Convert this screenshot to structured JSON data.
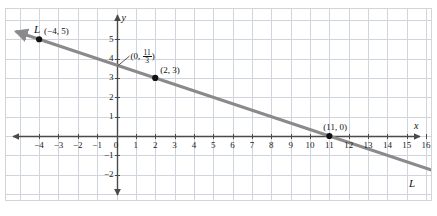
{
  "figure": {
    "width": 437,
    "height": 216,
    "background_color": "#ffffff",
    "frame_color": "#d4d4d4"
  },
  "chart_data": {
    "type": "line",
    "title": "",
    "xlabel": "x",
    "ylabel": "y",
    "xlim": [
      -5,
      17
    ],
    "ylim": [
      -2.7,
      5.9
    ],
    "grid": true,
    "grid_color": "#cfd4dd",
    "legend": "none",
    "axis_color": "#4a4a4a",
    "series": [
      {
        "name": "L",
        "color": "#8a8a8a",
        "slope": -0.3333333333,
        "intercept": 3.6666666667,
        "equation": "y = -1/3 x + 11/3",
        "x": [
          -5.2,
          17.0
        ],
        "y": [
          5.4,
          -2.0
        ],
        "arrow_start": true,
        "arrow_end": true,
        "points": [
          {
            "x": -4,
            "y": 5,
            "label": "(-4, 5)",
            "marker": true
          },
          {
            "x": 0,
            "y": 3.6666666667,
            "label": "(0, 11/3)",
            "marker": false
          },
          {
            "x": 2,
            "y": 3,
            "label": "(2, 3)",
            "marker": true
          },
          {
            "x": 11,
            "y": 0,
            "label": "(11, 0)",
            "marker": true
          }
        ]
      }
    ],
    "x_ticks": [
      -4,
      -3,
      -2,
      -1,
      0,
      1,
      2,
      3,
      4,
      5,
      6,
      7,
      8,
      9,
      10,
      11,
      12,
      13,
      14,
      15,
      16
    ],
    "x_tick_labels": [
      "-4",
      "-3",
      "-2",
      "-1",
      "0",
      "1",
      "2",
      "3",
      "4",
      "5",
      "6",
      "7",
      "8",
      "9",
      "10",
      "11",
      "12",
      "13",
      "14",
      "15",
      "16"
    ],
    "y_ticks": [
      5,
      4,
      3,
      2,
      1,
      -1,
      -2
    ],
    "y_tick_labels": [
      "5",
      "4",
      "3",
      "2",
      "1",
      "-1",
      "-2"
    ]
  },
  "axes": {
    "x_axis_label": "x",
    "y_axis_label": "y",
    "origin_label": "0"
  },
  "annotations": {
    "line_label_top_left": "L",
    "line_label_bottom_right": "L",
    "point_a_label": "(−4, 5)",
    "point_b_label": "(2, 3)",
    "point_c_label": "(11, 0)",
    "y_intercept_open": "(0, ",
    "y_intercept_numerator": "11",
    "y_intercept_denominator": "3",
    "y_intercept_close": ")"
  },
  "x_labels": [
    {
      "text": "−4",
      "value": -4
    },
    {
      "text": "−3",
      "value": -3
    },
    {
      "text": "−2",
      "value": -2
    },
    {
      "text": "−1",
      "value": -1
    },
    {
      "text": "0",
      "value": 0
    },
    {
      "text": "1",
      "value": 1
    },
    {
      "text": "2",
      "value": 2
    },
    {
      "text": "3",
      "value": 3
    },
    {
      "text": "4",
      "value": 4
    },
    {
      "text": "5",
      "value": 5
    },
    {
      "text": "6",
      "value": 6
    },
    {
      "text": "7",
      "value": 7
    },
    {
      "text": "8",
      "value": 8
    },
    {
      "text": "9",
      "value": 9
    },
    {
      "text": "10",
      "value": 10
    },
    {
      "text": "11",
      "value": 11
    },
    {
      "text": "12",
      "value": 12
    },
    {
      "text": "13",
      "value": 13
    },
    {
      "text": "14",
      "value": 14
    },
    {
      "text": "15",
      "value": 15
    },
    {
      "text": "16",
      "value": 16
    }
  ],
  "y_labels": [
    {
      "text": "5",
      "value": 5
    },
    {
      "text": "4",
      "value": 4
    },
    {
      "text": "3",
      "value": 3
    },
    {
      "text": "2",
      "value": 2
    },
    {
      "text": "1",
      "value": 1
    },
    {
      "text": "−1",
      "value": -1
    },
    {
      "text": "−2",
      "value": -2
    }
  ]
}
